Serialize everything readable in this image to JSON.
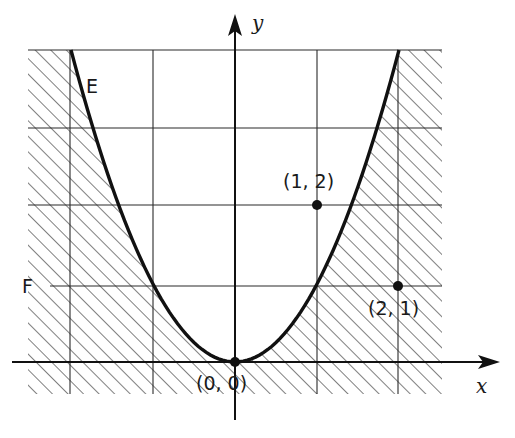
{
  "diagram": {
    "type": "region-plot",
    "axes": {
      "x_label": "x",
      "y_label": "y",
      "origin_px": [
        235,
        362
      ],
      "unit_px_x": 82,
      "unit_px_y": 78
    },
    "grid": {
      "x_lines": [
        -2,
        -1,
        1,
        2
      ],
      "y_lines": [
        1,
        2,
        3,
        4
      ],
      "x_range": [
        -2.52,
        2.52
      ],
      "y_range": [
        -0.41,
        4
      ]
    },
    "curve": {
      "label": "E",
      "equation": "y = x^2",
      "x_domain": [
        -2,
        2
      ]
    },
    "line_label": "F",
    "line_value": 1,
    "points": [
      {
        "label": "(0, 0)",
        "x": 0,
        "y": 0
      },
      {
        "label": "(1, 2)",
        "x": 1,
        "y": 2
      },
      {
        "label": "(2, 1)",
        "x": 2,
        "y": 1
      }
    ],
    "hatch_region": "outside parabola (y <= x^2) within grid rectangle",
    "colors": {
      "ink": "#1a1a1a",
      "background": "#ffffff"
    }
  }
}
